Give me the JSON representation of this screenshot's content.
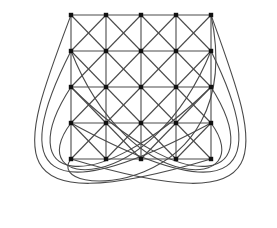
{
  "diagram": {
    "title": "",
    "type": "graph",
    "grid": {
      "cols": [
        71,
        106,
        141,
        176,
        211
      ],
      "rows": [
        15,
        51,
        87,
        123,
        159
      ]
    },
    "colors": {
      "edge": "#4a4a4a",
      "node": "#111111",
      "background": "#ffffff"
    },
    "wrap_curves": [
      {
        "from": [
          71,
          15
        ],
        "c1": [
          20,
          150
        ],
        "c2": [
          -10,
          225
        ],
        "to": [
          211,
          159
        ]
      },
      {
        "from": [
          71,
          51
        ],
        "c1": [
          10,
          170
        ],
        "c2": [
          40,
          215
        ],
        "to": [
          211,
          123
        ]
      },
      {
        "from": [
          71,
          87
        ],
        "c1": [
          10,
          180
        ],
        "c2": [
          90,
          205
        ],
        "to": [
          211,
          87
        ]
      },
      {
        "from": [
          71,
          123
        ],
        "c1": [
          20,
          190
        ],
        "c2": [
          150,
          200
        ],
        "to": [
          211,
          51
        ]
      },
      {
        "from": [
          71,
          159
        ],
        "c1": [
          40,
          200
        ],
        "c2": [
          250,
          200
        ],
        "to": [
          211,
          15
        ]
      },
      {
        "from": [
          211,
          15
        ],
        "c1": [
          260,
          150
        ],
        "c2": [
          290,
          225
        ],
        "to": [
          71,
          159
        ]
      },
      {
        "from": [
          211,
          51
        ],
        "c1": [
          270,
          170
        ],
        "c2": [
          240,
          215
        ],
        "to": [
          71,
          123
        ]
      },
      {
        "from": [
          211,
          87
        ],
        "c1": [
          270,
          180
        ],
        "c2": [
          190,
          205
        ],
        "to": [
          71,
          87
        ]
      },
      {
        "from": [
          211,
          123
        ],
        "c1": [
          260,
          190
        ],
        "c2": [
          130,
          200
        ],
        "to": [
          71,
          51
        ]
      }
    ]
  }
}
